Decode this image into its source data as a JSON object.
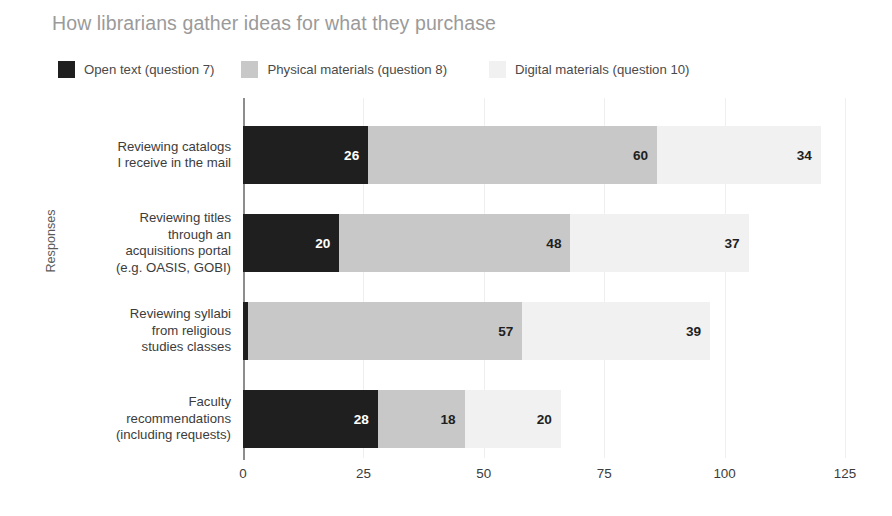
{
  "chart_data": {
    "type": "bar",
    "orientation": "horizontal",
    "stacked": true,
    "title": "How librarians gather ideas for what they purchase",
    "xlabel": "",
    "ylabel": "Responses",
    "xlim": [
      0,
      125
    ],
    "xticks": [
      "0",
      "25",
      "50",
      "75",
      "100",
      "125"
    ],
    "grid": true,
    "legend_position": "top-left",
    "categories": [
      "Reviewing catalogs\nI receive in the mail",
      "Reviewing titles\nthrough an\nacquisitions portal\n(e.g. OASIS, GOBI)",
      "Reviewing syllabi\nfrom religious\nstudies classes",
      "Faculty\nrecommendations\n(including requests)"
    ],
    "category_lines": [
      [
        "Reviewing catalogs",
        "I receive in the mail"
      ],
      [
        "Reviewing titles",
        "through an",
        "acquisitions portal",
        "(e.g. OASIS, GOBI)"
      ],
      [
        "Reviewing syllabi",
        "from religious",
        "studies classes"
      ],
      [
        "Faculty",
        "recommendations",
        "(including requests)"
      ]
    ],
    "series": [
      {
        "name": "Open text (question 7)",
        "color": "#1f1f1f",
        "label_color": "#ffffff",
        "values": [
          26,
          20,
          1,
          28
        ]
      },
      {
        "name": "Physical materials (question 8)",
        "color": "#c8c8c8",
        "label_color": "#1f1f1f",
        "values": [
          60,
          48,
          57,
          18
        ]
      },
      {
        "name": "Digital materials (question 10)",
        "color": "#f1f1f1",
        "label_color": "#1f1f1f",
        "values": [
          34,
          37,
          39,
          20
        ]
      }
    ],
    "totals": [
      120,
      105,
      97,
      66
    ]
  },
  "legend": {
    "items": [
      {
        "label": "Open text (question 7)",
        "color": "#1f1f1f"
      },
      {
        "label": "Physical materials (question 8)",
        "color": "#c8c8c8"
      },
      {
        "label": "Digital materials (question 10)",
        "color": "#f1f1f1"
      }
    ]
  },
  "axis": {
    "y_title": "Responses",
    "x_ticks": [
      "0",
      "25",
      "50",
      "75",
      "100",
      "125"
    ]
  }
}
